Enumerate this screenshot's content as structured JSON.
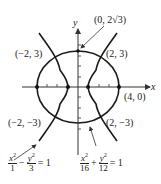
{
  "axes": {
    "x_label": "x",
    "y_label": "y"
  },
  "points": {
    "top_vertex": "(0, 2√3)",
    "upper_left": "(−2, 3)",
    "upper_right": "(2, 3)",
    "right_vertex": "(4, 0)",
    "lower_left": "(−2, −3)",
    "lower_right": "(2, −3)"
  },
  "equations": {
    "hyperbola": {
      "t1_num": "x",
      "t1_den": "1",
      "op": "−",
      "t2_num": "y",
      "t2_den": "3",
      "rhs": "= 1",
      "exp": "2"
    },
    "ellipse": {
      "t1_num": "x",
      "t1_den": "16",
      "op": "+",
      "t2_num": "y",
      "t2_den": "12",
      "rhs": "= 1",
      "exp": "2"
    }
  },
  "colors": {
    "curve": "#1a1a1a",
    "axis": "#333333"
  }
}
